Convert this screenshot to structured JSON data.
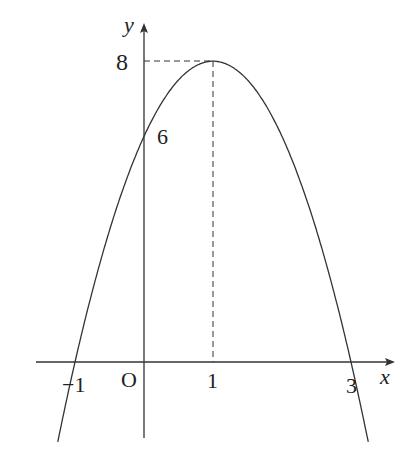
{
  "chart_data": {
    "type": "line",
    "title": "",
    "function": "y = -2(x-1)^2 + 8",
    "xlabel": "x",
    "ylabel": "y",
    "origin_label": "O",
    "x": [
      -1.2,
      -1,
      0,
      1,
      2,
      3,
      3.2
    ],
    "values": [
      -1.68,
      0,
      6,
      8,
      6,
      0,
      -1.68
    ],
    "x_ticks": [
      "-1",
      "1",
      "3"
    ],
    "y_ticks": [
      "6",
      "8"
    ],
    "vertex": [
      1,
      8
    ],
    "y_intercept": 6,
    "x_intercepts": [
      -1,
      3
    ],
    "guides": "dashed lines from vertex (1,8) to axes",
    "grid": false
  },
  "labels": {
    "y_axis": "y",
    "x_axis": "x",
    "origin": "O",
    "y8": "8",
    "y6": "6",
    "xm1": "−1",
    "x1": "1",
    "x3": "3"
  }
}
